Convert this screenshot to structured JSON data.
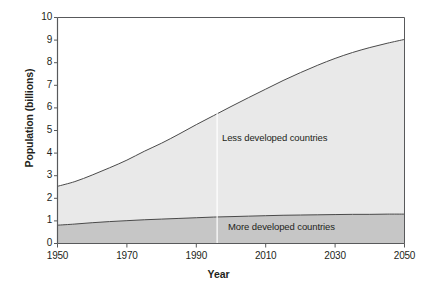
{
  "chart_data": {
    "type": "area",
    "title": "",
    "xlabel": "Year",
    "ylabel": "Population (billions)",
    "xlim": [
      1950,
      2050
    ],
    "ylim": [
      0,
      10
    ],
    "grid": false,
    "legend_position": "inline-annotation",
    "stacked": true,
    "xticks": [
      "1950",
      "1970",
      "1990",
      "2010",
      "2030",
      "2050"
    ],
    "xtick_values": [
      1950,
      1970,
      1990,
      2010,
      2030,
      2050
    ],
    "yticks": [
      "0",
      "1",
      "2",
      "3",
      "4",
      "5",
      "6",
      "7",
      "8",
      "9",
      "10"
    ],
    "ytick_values": [
      0,
      1,
      2,
      3,
      4,
      5,
      6,
      7,
      8,
      9,
      10
    ],
    "annotations": [
      {
        "text": "Less developed countries",
        "x": 2005,
        "y": 4.9
      },
      {
        "text": "More developed countries",
        "x": 2012,
        "y": 0.95
      }
    ],
    "divider_year": 1996,
    "x": [
      1950,
      1955,
      1960,
      1965,
      1970,
      1975,
      1980,
      1985,
      1990,
      1995,
      2000,
      2005,
      2010,
      2015,
      2020,
      2025,
      2030,
      2035,
      2040,
      2045,
      2050
    ],
    "series": [
      {
        "name": "More developed countries",
        "color": "#c6c6c6",
        "values": [
          0.81,
          0.86,
          0.92,
          0.97,
          1.01,
          1.05,
          1.08,
          1.11,
          1.14,
          1.17,
          1.19,
          1.21,
          1.23,
          1.25,
          1.26,
          1.27,
          1.28,
          1.29,
          1.29,
          1.3,
          1.3
        ]
      },
      {
        "name": "Less developed countries",
        "color": "#e9e9e9",
        "values": [
          1.72,
          1.88,
          2.11,
          2.38,
          2.68,
          3.03,
          3.36,
          3.73,
          4.12,
          4.49,
          4.87,
          5.24,
          5.6,
          5.96,
          6.3,
          6.62,
          6.91,
          7.16,
          7.38,
          7.56,
          7.73
        ]
      }
    ],
    "totals": [
      2.53,
      2.74,
      3.03,
      3.35,
      3.69,
      4.08,
      4.44,
      4.84,
      5.26,
      5.66,
      6.06,
      6.45,
      6.83,
      7.21,
      7.56,
      7.89,
      8.19,
      8.45,
      8.67,
      8.86,
      9.03
    ]
  },
  "axes": {
    "y_title": "Population (billions)",
    "x_title": "Year"
  },
  "labels": {
    "less_developed": "Less developed countries",
    "more_developed": "More developed countries"
  },
  "colors": {
    "upper_band": "#e9e9e9",
    "lower_band": "#c6c6c6",
    "axis": "#58595b",
    "curve": "#4a4a4a",
    "divider": "#ffffff",
    "text": "#231f20"
  }
}
